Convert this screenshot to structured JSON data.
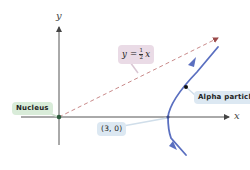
{
  "diagram": {
    "axes": {
      "x_label": "x",
      "y_label": "y"
    },
    "labels": {
      "nucleus": "Nucleus",
      "alpha_particle": "Alpha particle",
      "vertex_point": "(3, 0)",
      "asymptote_lhs": "y =",
      "asymptote_num": "1",
      "asymptote_den": "2",
      "asymptote_rhs": "x"
    },
    "elements": {
      "asymptote": "y = 1/2 x (dashed line from origin)",
      "trajectory": "hyperbola branch with vertex at (3, 0)",
      "nucleus_position": "origin"
    },
    "colors": {
      "axis": "#555555",
      "asymptote": "#c98a8a",
      "trajectory": "#5a6fc0",
      "nucleus_dot": "#2d5a3d",
      "particle_dot": "#111111",
      "nucleus_label_bg": "#d9ecd9",
      "alpha_label_bg": "#dce8f2",
      "point_label_bg": "#dce8f2",
      "equation_label_bg": "#eadbe6"
    }
  }
}
